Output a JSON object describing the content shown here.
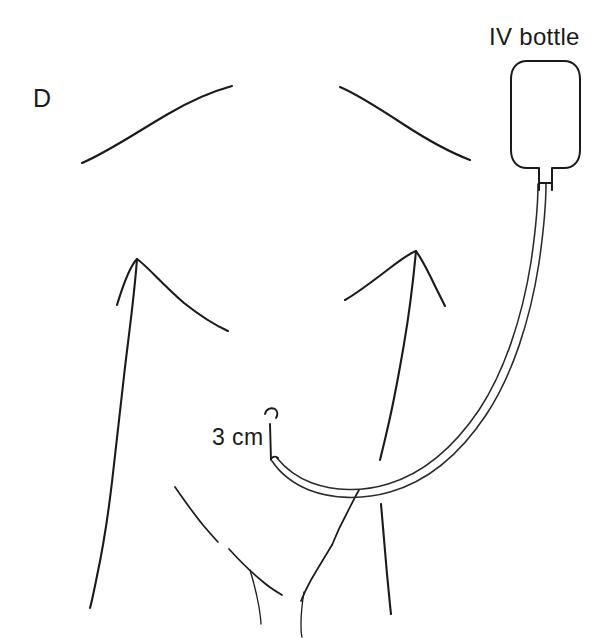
{
  "figure": {
    "panel_label": "D",
    "background_color": "#ffffff",
    "ink_color": "#1a1a1a",
    "width": 612,
    "height": 638
  },
  "annotations": {
    "iv_bottle_label": "IV bottle",
    "measurement_label": "3 cm"
  },
  "elements": {
    "torso_name": "torso-outline",
    "catheter_name": "catheter-tubing",
    "bottle_name": "iv-bottle",
    "measure_name": "catheter-length-measure"
  }
}
